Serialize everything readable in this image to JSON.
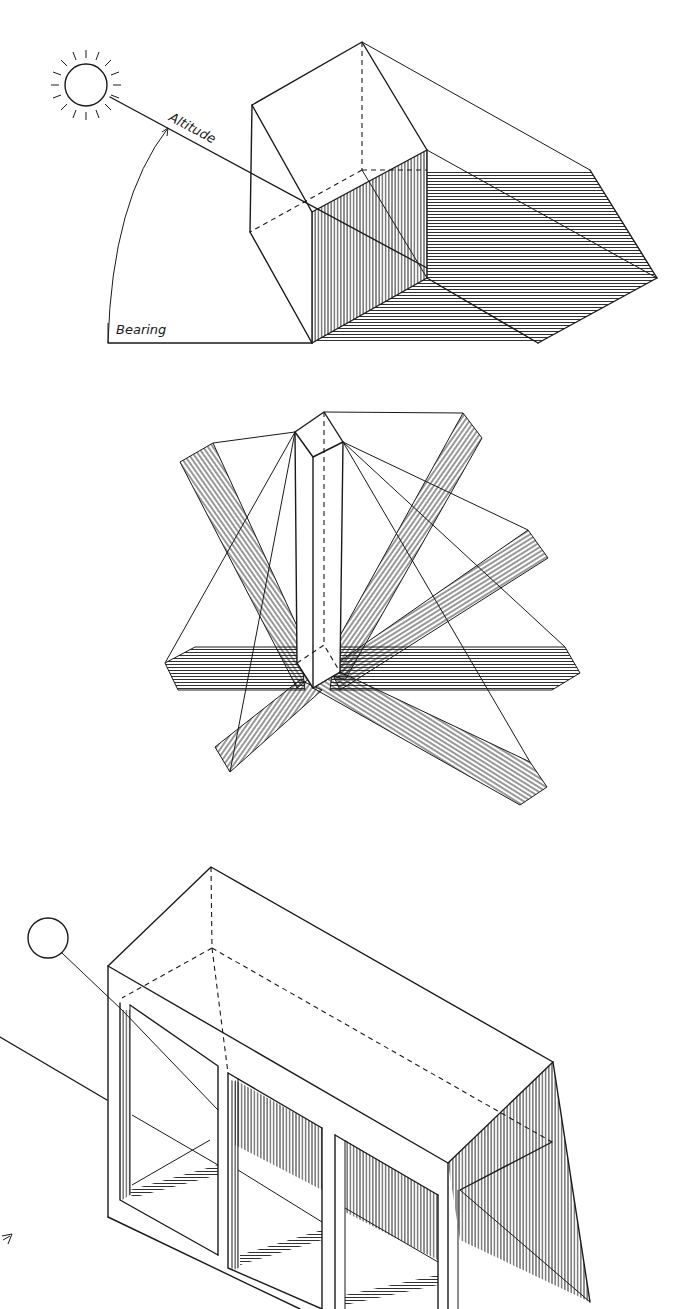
{
  "figures": [
    {
      "id": "sun-angle-diagram",
      "labels": {
        "altitude": "Altitude",
        "bearing": "Bearing"
      },
      "description": "Box casting shadow with sun altitude and bearing angles"
    },
    {
      "id": "pillar-shadow-diagram",
      "description": "Vertical prism casting multiple shadows from different sun positions"
    },
    {
      "id": "building-facade-diagram",
      "description": "Box building with recessed openings and cast shadows"
    }
  ],
  "colors": {
    "ink": "#1a1a1a",
    "paper": "#ffffff"
  }
}
